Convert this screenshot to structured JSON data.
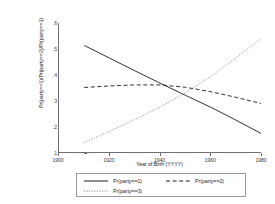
{
  "chart_data": {
    "type": "line",
    "title": "",
    "xlabel": "Year of Birth (YYYY)",
    "ylabel": "Pr(party==1)/Pr(party==2)/Pr(party==3)",
    "xlim": [
      1900,
      1980
    ],
    "ylim": [
      0.1,
      0.6
    ],
    "xticks": [
      "1900",
      "1920",
      "1940",
      "1960",
      "1980"
    ],
    "xtick_values": [
      1900,
      1920,
      1940,
      1960,
      1980
    ],
    "yticks": [
      ".1",
      ".2",
      ".3",
      ".4",
      ".5",
      ".6"
    ],
    "ytick_values": [
      0.1,
      0.2,
      0.3,
      0.4,
      0.5,
      0.6
    ],
    "grid": false,
    "legend_position": "bottom",
    "x": [
      1910,
      1920,
      1930,
      1940,
      1950,
      1960,
      1970,
      1980
    ],
    "series": [
      {
        "name": "Pr(party==1)",
        "style": "solid",
        "color": "#1a1a1a",
        "values": [
          0.513,
          0.464,
          0.415,
          0.367,
          0.32,
          0.274,
          0.224,
          0.172
        ]
      },
      {
        "name": "Pr(party==2)",
        "style": "dashed",
        "color": "#1a1a1a",
        "values": [
          0.35,
          0.356,
          0.36,
          0.36,
          0.351,
          0.334,
          0.312,
          0.288
        ]
      },
      {
        "name": "Pr(party==3)",
        "style": "dotted",
        "color": "#7a7a7a",
        "values": [
          0.137,
          0.18,
          0.226,
          0.274,
          0.329,
          0.392,
          0.464,
          0.54
        ]
      }
    ]
  },
  "legend": {
    "entries": [
      {
        "label": "Pr(party==1)",
        "style": "solid"
      },
      {
        "label": "Pr(party==2)",
        "style": "dashed"
      },
      {
        "label": "Pr(party==3)",
        "style": "dotted"
      }
    ]
  }
}
